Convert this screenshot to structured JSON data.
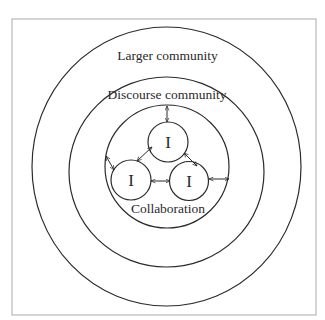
{
  "diagram": {
    "type": "nested-circles",
    "frame": {
      "x": 12,
      "y": 19,
      "width": 304,
      "height": 296,
      "stroke": "#b8b8b8"
    },
    "stroke_color": "#2b2b2b",
    "rings": [
      {
        "id": "larger-community",
        "label": "Larger community",
        "cx": 166.5,
        "cy": 166.5,
        "rx": 134.5,
        "ry": 139.5
      },
      {
        "id": "discourse-community",
        "label": "Discourse community",
        "cx": 166.5,
        "cy": 172,
        "rx": 97.5,
        "ry": 95
      },
      {
        "id": "collaboration",
        "label": "Collaboration",
        "cx": 167,
        "cy": 166.5,
        "rx": 62,
        "ry": 61.5
      }
    ],
    "individuals": [
      {
        "id": "individual-top",
        "label": "I",
        "cx": 168,
        "cy": 142,
        "r": 20
      },
      {
        "id": "individual-left",
        "label": "I",
        "cx": 131,
        "cy": 180,
        "r": 20
      },
      {
        "id": "individual-right",
        "label": "I",
        "cx": 189,
        "cy": 181,
        "r": 19.5
      }
    ],
    "arrows": [
      {
        "id": "top-to-discourse",
        "x1": 167,
        "y1": 106,
        "x2": 167,
        "y2": 122
      },
      {
        "id": "left-to-top",
        "x1": 137,
        "y1": 161,
        "x2": 152,
        "y2": 147
      },
      {
        "id": "top-to-right",
        "x1": 184,
        "y1": 153,
        "x2": 197,
        "y2": 166
      },
      {
        "id": "left-to-right",
        "x1": 151,
        "y1": 181,
        "x2": 170,
        "y2": 181
      },
      {
        "id": "left-to-collab-edge",
        "x1": 106,
        "y1": 156,
        "x2": 114,
        "y2": 170
      },
      {
        "id": "right-to-collab-edge",
        "x1": 209,
        "y1": 179,
        "x2": 229,
        "y2": 179
      }
    ],
    "labels": {
      "larger": {
        "text": "Larger community",
        "x": 167.5,
        "y": 60
      },
      "discourse": {
        "text": "Discourse community",
        "x": 167,
        "y": 99
      },
      "collaboration": {
        "text": "Collaboration",
        "x": 168,
        "y": 213
      }
    }
  }
}
